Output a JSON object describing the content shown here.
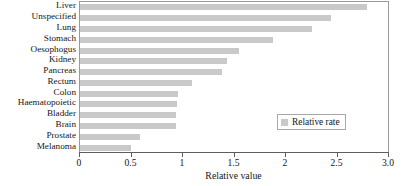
{
  "chart_data": {
    "type": "bar",
    "orientation": "horizontal",
    "title": "",
    "xlabel": "Relative value",
    "ylabel": "",
    "xlim": [
      0,
      3.0
    ],
    "xticks": [
      0,
      0.5,
      1,
      1.5,
      2,
      2.5,
      3.0
    ],
    "xtick_labels": [
      "0",
      "0.5",
      "1",
      "1.5",
      "2",
      "2.5",
      "3.0"
    ],
    "grid": false,
    "legend_position": "center-right",
    "bar_color": "#c9c9c9",
    "frame_color": "#9a9a9a",
    "categories": [
      "Liver",
      "Unspecified",
      "Lung",
      "Stomach",
      "Oesophogus",
      "Kidney",
      "Pancreas",
      "Rectum",
      "Colon",
      "Haematopoietic",
      "Bladder",
      "Brain",
      "Prostate",
      "Melanoma"
    ],
    "series": [
      {
        "name": "Relative rate",
        "values": [
          2.8,
          2.45,
          2.26,
          1.88,
          1.55,
          1.44,
          1.39,
          1.1,
          0.96,
          0.95,
          0.94,
          0.94,
          0.59,
          0.5
        ]
      }
    ]
  },
  "legend": {
    "entries": [
      {
        "label": "Relative rate",
        "color": "#c9c9c9"
      }
    ]
  }
}
